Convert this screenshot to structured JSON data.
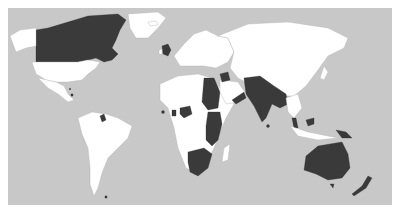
{
  "map": {
    "type": "world choropleth",
    "colors": {
      "ocean": "#c8c8c8",
      "land": "#ffffff",
      "highlighted": "#3a3a3a",
      "borders": "#b4b4b4"
    },
    "highlighted_regions": [
      "Canada",
      "United Kingdom",
      "Belize",
      "Jamaica",
      "Bahamas",
      "Guyana",
      "Trinidad and Tobago",
      "Falkland Islands",
      "Gambia",
      "Sierra Leone",
      "Ghana",
      "Nigeria",
      "Cameroon",
      "Sudan",
      "Egypt",
      "Uganda",
      "Kenya",
      "Tanzania",
      "Zambia",
      "Malawi",
      "Zimbabwe",
      "Botswana",
      "Namibia",
      "South Africa",
      "Lesotho",
      "Swaziland",
      "Somaliland",
      "Aden (Yemen)",
      "Oman",
      "Kuwait",
      "Iraq",
      "Jordan",
      "Palestine",
      "Cyprus",
      "India",
      "Pakistan",
      "Bangladesh",
      "Burma",
      "Sri Lanka",
      "Malaysia",
      "Singapore",
      "Brunei",
      "Papua New Guinea",
      "Australia",
      "New Zealand"
    ]
  }
}
